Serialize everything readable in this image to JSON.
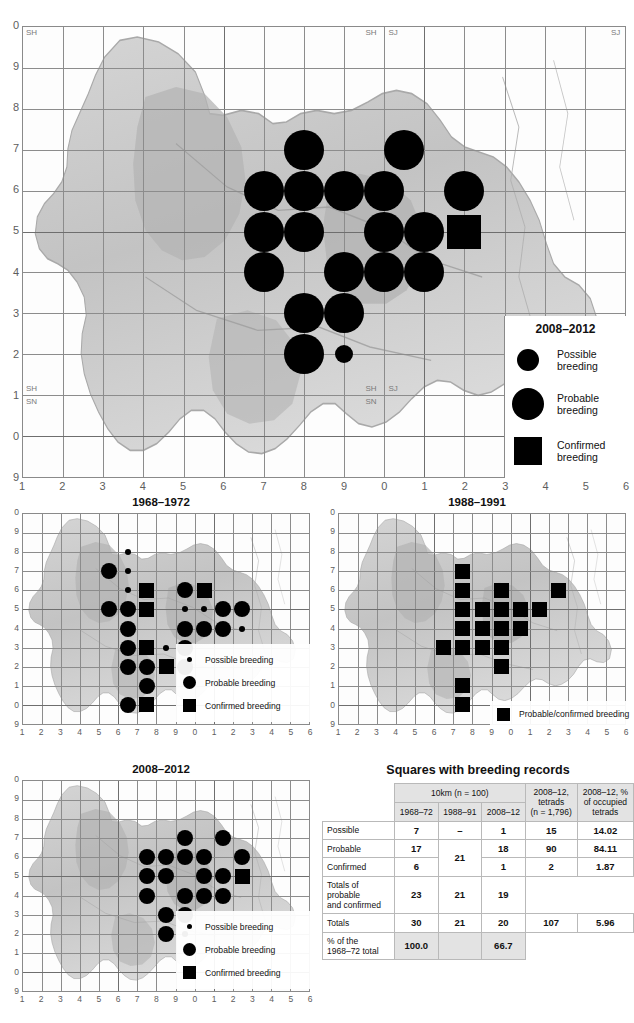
{
  "page": {
    "width": 634,
    "height": 1023,
    "cropped_top_text": ""
  },
  "main_map": {
    "name": "main-distribution-map",
    "legend_title": "2008–2012",
    "legend": [
      {
        "symbol": "circle",
        "size": "small",
        "label_line1": "Possible",
        "label_line2": "breeding"
      },
      {
        "symbol": "circle",
        "size": "large",
        "label_line1": "Probable",
        "label_line2": "breeding"
      },
      {
        "symbol": "square",
        "size": "large",
        "label_line1": "Confirmed",
        "label_line2": "breeding"
      }
    ],
    "x_labels": [
      "1",
      "2",
      "3",
      "4",
      "5",
      "6",
      "7",
      "8",
      "9",
      "0",
      "1",
      "2",
      "3",
      "4",
      "5",
      "6"
    ],
    "y_labels": [
      "0",
      "9",
      "8",
      "7",
      "6",
      "5",
      "4",
      "3",
      "2",
      "1",
      "0",
      "9"
    ],
    "sheet_codes": [
      {
        "text": "SH",
        "corner": "top-left"
      },
      {
        "text": "SH",
        "corner": "top-mid-left"
      },
      {
        "text": "SJ",
        "corner": "top-mid-right"
      },
      {
        "text": "SJ",
        "corner": "top-right"
      },
      {
        "text": "SH\nSN",
        "corner": "bottom-left"
      },
      {
        "text": "SH  SJ\nSN",
        "corner": "bottom-mid"
      }
    ],
    "symbols": [
      {
        "col": 8,
        "row": 6.5,
        "type": "probable"
      },
      {
        "col": 10.5,
        "row": 6.5,
        "type": "probable"
      },
      {
        "col": 7,
        "row": 5.5,
        "type": "probable"
      },
      {
        "col": 8,
        "row": 5.5,
        "type": "probable"
      },
      {
        "col": 9,
        "row": 5.5,
        "type": "probable"
      },
      {
        "col": 10,
        "row": 5.5,
        "type": "probable"
      },
      {
        "col": 12,
        "row": 5.5,
        "type": "probable"
      },
      {
        "col": 7,
        "row": 4.5,
        "type": "probable"
      },
      {
        "col": 8,
        "row": 4.5,
        "type": "probable"
      },
      {
        "col": 10,
        "row": 4.5,
        "type": "probable"
      },
      {
        "col": 11,
        "row": 4.5,
        "type": "probable"
      },
      {
        "col": 12,
        "row": 4.5,
        "type": "confirmed"
      },
      {
        "col": 7,
        "row": 3.5,
        "type": "probable"
      },
      {
        "col": 9,
        "row": 3.5,
        "type": "probable"
      },
      {
        "col": 10,
        "row": 3.5,
        "type": "probable"
      },
      {
        "col": 11,
        "row": 3.5,
        "type": "probable"
      },
      {
        "col": 8,
        "row": 2.5,
        "type": "probable"
      },
      {
        "col": 9,
        "row": 2.5,
        "type": "probable"
      },
      {
        "col": 8,
        "row": 1.5,
        "type": "probable"
      },
      {
        "col": 9,
        "row": 1.5,
        "type": "possible"
      }
    ]
  },
  "small_maps": [
    {
      "name": "map-1968-1972",
      "title": "1968–1972",
      "x_labels": [
        "1",
        "2",
        "3",
        "4",
        "5",
        "6",
        "7",
        "8",
        "9",
        "0",
        "1",
        "2",
        "3",
        "4",
        "5",
        "6"
      ],
      "y_labels": [
        "0",
        "9",
        "8",
        "7",
        "6",
        "5",
        "4",
        "3",
        "2",
        "1",
        "0",
        "9"
      ],
      "legend": [
        {
          "symbol": "circle",
          "size": "small",
          "label": "Possible breeding"
        },
        {
          "symbol": "circle",
          "size": "large",
          "label": "Probable breeding"
        },
        {
          "symbol": "square",
          "size": "large",
          "label": "Confirmed breeding"
        }
      ],
      "symbols": [
        {
          "col": 6.5,
          "row": 7.5,
          "type": "possible"
        },
        {
          "col": 5.5,
          "row": 6.5,
          "type": "probable"
        },
        {
          "col": 6.5,
          "row": 6.5,
          "type": "possible"
        },
        {
          "col": 6.5,
          "row": 5.5,
          "type": "possible"
        },
        {
          "col": 7.5,
          "row": 5.5,
          "type": "confirmed"
        },
        {
          "col": 9.5,
          "row": 5.5,
          "type": "probable"
        },
        {
          "col": 10.5,
          "row": 5.5,
          "type": "confirmed"
        },
        {
          "col": 5.5,
          "row": 4.5,
          "type": "probable"
        },
        {
          "col": 6.5,
          "row": 4.5,
          "type": "probable"
        },
        {
          "col": 7.5,
          "row": 4.5,
          "type": "confirmed"
        },
        {
          "col": 9.5,
          "row": 4.5,
          "type": "possible"
        },
        {
          "col": 10.5,
          "row": 4.5,
          "type": "possible"
        },
        {
          "col": 11.5,
          "row": 4.5,
          "type": "probable"
        },
        {
          "col": 12.5,
          "row": 4.5,
          "type": "probable"
        },
        {
          "col": 6.5,
          "row": 3.5,
          "type": "probable"
        },
        {
          "col": 9.5,
          "row": 3.5,
          "type": "probable"
        },
        {
          "col": 10.5,
          "row": 3.5,
          "type": "probable"
        },
        {
          "col": 11.5,
          "row": 3.5,
          "type": "probable"
        },
        {
          "col": 12.5,
          "row": 3.5,
          "type": "possible"
        },
        {
          "col": 6.5,
          "row": 2.5,
          "type": "probable"
        },
        {
          "col": 7.5,
          "row": 2.5,
          "type": "confirmed"
        },
        {
          "col": 8.5,
          "row": 2.5,
          "type": "possible"
        },
        {
          "col": 9.5,
          "row": 2.5,
          "type": "probable"
        },
        {
          "col": 6.5,
          "row": 1.5,
          "type": "probable"
        },
        {
          "col": 7.5,
          "row": 1.5,
          "type": "probable"
        },
        {
          "col": 8.5,
          "row": 1.5,
          "type": "confirmed"
        },
        {
          "col": 9.5,
          "row": 1.5,
          "type": "probable"
        },
        {
          "col": 7.5,
          "row": 0.5,
          "type": "probable"
        },
        {
          "col": 6.5,
          "row": -0.5,
          "type": "probable"
        },
        {
          "col": 7.5,
          "row": -0.5,
          "type": "confirmed"
        }
      ]
    },
    {
      "name": "map-1988-1991",
      "title": "1988–1991",
      "x_labels": [
        "1",
        "2",
        "3",
        "4",
        "5",
        "6",
        "7",
        "8",
        "9",
        "0",
        "1",
        "2",
        "3",
        "4",
        "5",
        "6"
      ],
      "y_labels": [
        "0",
        "9",
        "8",
        "7",
        "6",
        "5",
        "4",
        "3",
        "2",
        "1",
        "0",
        "9"
      ],
      "legend": [
        {
          "symbol": "square",
          "size": "large",
          "label": "Probable/confirmed breeding"
        }
      ],
      "symbols": [
        {
          "col": 7.5,
          "row": 6.5,
          "type": "confirmed"
        },
        {
          "col": 7.5,
          "row": 5.5,
          "type": "confirmed"
        },
        {
          "col": 9.5,
          "row": 5.5,
          "type": "confirmed"
        },
        {
          "col": 12.5,
          "row": 5.5,
          "type": "confirmed"
        },
        {
          "col": 7.5,
          "row": 4.5,
          "type": "confirmed"
        },
        {
          "col": 8.5,
          "row": 4.5,
          "type": "confirmed"
        },
        {
          "col": 9.5,
          "row": 4.5,
          "type": "confirmed"
        },
        {
          "col": 10.5,
          "row": 4.5,
          "type": "confirmed"
        },
        {
          "col": 11.5,
          "row": 4.5,
          "type": "confirmed"
        },
        {
          "col": 7.5,
          "row": 3.5,
          "type": "confirmed"
        },
        {
          "col": 8.5,
          "row": 3.5,
          "type": "confirmed"
        },
        {
          "col": 9.5,
          "row": 3.5,
          "type": "confirmed"
        },
        {
          "col": 10.5,
          "row": 3.5,
          "type": "confirmed"
        },
        {
          "col": 6.5,
          "row": 2.5,
          "type": "confirmed"
        },
        {
          "col": 7.5,
          "row": 2.5,
          "type": "confirmed"
        },
        {
          "col": 8.5,
          "row": 2.5,
          "type": "confirmed"
        },
        {
          "col": 9.5,
          "row": 2.5,
          "type": "confirmed"
        },
        {
          "col": 9.5,
          "row": 1.5,
          "type": "confirmed"
        },
        {
          "col": 7.5,
          "row": 0.5,
          "type": "confirmed"
        },
        {
          "col": 7.5,
          "row": -0.5,
          "type": "confirmed"
        }
      ]
    },
    {
      "name": "map-2008-2012",
      "title": "2008–2012",
      "x_labels": [
        "1",
        "2",
        "3",
        "4",
        "5",
        "6",
        "7",
        "8",
        "9",
        "0",
        "1",
        "2",
        "3",
        "4",
        "5",
        "6"
      ],
      "y_labels": [
        "0",
        "9",
        "8",
        "7",
        "6",
        "5",
        "4",
        "3",
        "2",
        "1",
        "0",
        "9"
      ],
      "legend": [
        {
          "symbol": "circle",
          "size": "small",
          "label": "Possible breeding"
        },
        {
          "symbol": "circle",
          "size": "large",
          "label": "Probable breeding"
        },
        {
          "symbol": "square",
          "size": "large",
          "label": "Confirmed breeding"
        }
      ],
      "symbols": [
        {
          "col": 9.5,
          "row": 6.5,
          "type": "probable"
        },
        {
          "col": 11.5,
          "row": 6.5,
          "type": "probable"
        },
        {
          "col": 7.5,
          "row": 5.5,
          "type": "probable"
        },
        {
          "col": 8.5,
          "row": 5.5,
          "type": "probable"
        },
        {
          "col": 9.5,
          "row": 5.5,
          "type": "probable"
        },
        {
          "col": 10.5,
          "row": 5.5,
          "type": "probable"
        },
        {
          "col": 12.5,
          "row": 5.5,
          "type": "probable"
        },
        {
          "col": 7.5,
          "row": 4.5,
          "type": "probable"
        },
        {
          "col": 8.5,
          "row": 4.5,
          "type": "probable"
        },
        {
          "col": 10.5,
          "row": 4.5,
          "type": "probable"
        },
        {
          "col": 11.5,
          "row": 4.5,
          "type": "probable"
        },
        {
          "col": 12.5,
          "row": 4.5,
          "type": "confirmed"
        },
        {
          "col": 7.5,
          "row": 3.5,
          "type": "probable"
        },
        {
          "col": 9.5,
          "row": 3.5,
          "type": "probable"
        },
        {
          "col": 10.5,
          "row": 3.5,
          "type": "probable"
        },
        {
          "col": 11.5,
          "row": 3.5,
          "type": "probable"
        },
        {
          "col": 8.5,
          "row": 2.5,
          "type": "probable"
        },
        {
          "col": 9.5,
          "row": 2.5,
          "type": "probable"
        },
        {
          "col": 8.5,
          "row": 1.5,
          "type": "probable"
        },
        {
          "col": 9.5,
          "row": 1.5,
          "type": "possible"
        }
      ]
    }
  ],
  "table": {
    "title": "Squares with breeding records",
    "group_header": "10km (n = 100)",
    "columns": [
      "1968–72",
      "1988–91",
      "2008–12"
    ],
    "col_tetrads": "2008–12,\ntetrads\n(n = 1,796)",
    "col_tetrads_lines": [
      "2008–12,",
      "tetrads",
      "(n = 1,796)"
    ],
    "col_pct": "2008–12, %\nof occupied\ntetrads",
    "col_pct_lines": [
      "2008–12, %",
      "of occupied",
      "tetrads"
    ],
    "rows": [
      {
        "label": "Possible",
        "label_lines": [
          "Possible"
        ],
        "c1968": "7",
        "c1988": "–",
        "c2008": "1",
        "tetrads": "15",
        "pct": "14.02"
      },
      {
        "label": "Probable",
        "label_lines": [
          "Probable"
        ],
        "c1968": "17",
        "c1988": "21",
        "c2008": "18",
        "tetrads": "90",
        "pct": "84.11"
      },
      {
        "label": "Confirmed",
        "label_lines": [
          "Confirmed"
        ],
        "c1968": "6",
        "c1988": "",
        "c2008": "1",
        "tetrads": "2",
        "pct": "1.87"
      },
      {
        "label": "Totals of probable and confirmed",
        "label_lines": [
          "Totals of probable",
          "and confirmed"
        ],
        "c1968": "23",
        "c1988": "21",
        "c2008": "19",
        "tetrads": "",
        "pct": ""
      },
      {
        "label": "Totals",
        "label_lines": [
          "Totals"
        ],
        "c1968": "30",
        "c1988": "21",
        "c2008": "20",
        "tetrads": "107",
        "pct": "5.96"
      },
      {
        "label": "% of the 1968–72 total",
        "label_lines": [
          "% of the",
          "1968–72 total"
        ],
        "c1968": "100.0",
        "c1988": "",
        "c2008": "66.7",
        "tetrads": "",
        "pct": ""
      }
    ]
  },
  "colors": {
    "symbol": "#000000",
    "grid": "#8c8c8c",
    "axis_text": "#5d5d5d",
    "table_header_bg": "#e3e3e3",
    "table_border": "#b9b9b9"
  }
}
